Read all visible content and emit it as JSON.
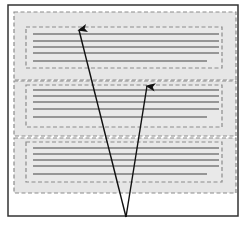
{
  "figure": {
    "colors": {
      "frame": "#333333",
      "region_fill": "#e6e6e6",
      "dash": "#8c8c8c",
      "text_line": "#7a7a7a",
      "arrow": "#111111",
      "background": "#ffffff"
    },
    "sections": [
      {
        "id": "section-1",
        "lines": 5
      },
      {
        "id": "section-2",
        "lines": 5
      },
      {
        "id": "section-3",
        "lines": 5
      }
    ],
    "arrows": [
      {
        "id": "arrow-to-section-1"
      },
      {
        "id": "arrow-to-section-2"
      }
    ]
  }
}
